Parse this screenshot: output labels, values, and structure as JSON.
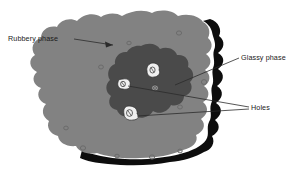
{
  "figure": {
    "background_color": "#ffffff"
  },
  "labels": {
    "rubbery": "Rubbery phase",
    "glassy": "Glassy phase",
    "holes": "Holes"
  },
  "colors": {
    "rubbery_phase": "#828282",
    "glassy_phase": "#4a4a4a",
    "shadow_edge": "#0d0d0d",
    "hole_fill": "#f2f2f2",
    "hole_detail": "#3d3d3d",
    "pore": "#6e6e6e",
    "leader_line": "#2b2b2b",
    "text": "#1a1a1a",
    "background": "#ffffff"
  },
  "regions": [
    {
      "name": "rubbery-phase",
      "label": "Rubbery phase",
      "fill": "#828282",
      "description": "Large irregular light-gray matrix blob occupying the centre of the figure"
    },
    {
      "name": "glassy-phase",
      "label": "Glassy phase",
      "fill": "#4a4a4a",
      "description": "Darker irregular domain embedded within the rubbery matrix, slightly right of centre"
    },
    {
      "name": "shadow-edge",
      "label": "",
      "fill": "#0d0d0d",
      "description": "Thick black drop-shadow rim along the right and bottom outline of the matrix"
    }
  ],
  "holes": [
    {
      "name": "hole-top",
      "cx": 153,
      "cy": 70,
      "r": 6.0
    },
    {
      "name": "hole-left",
      "cx": 123,
      "cy": 84,
      "r": 5.2
    },
    {
      "name": "hole-bottom",
      "cx": 130,
      "cy": 113,
      "r": 6.4
    },
    {
      "name": "hole-small-right",
      "cx": 155,
      "cy": 88,
      "r": 3.4
    }
  ],
  "pores": [
    {
      "cx": 179,
      "cy": 33
    },
    {
      "cx": 129,
      "cy": 43
    },
    {
      "cx": 101,
      "cy": 67
    },
    {
      "cx": 204,
      "cy": 82
    },
    {
      "cx": 180,
      "cy": 107
    },
    {
      "cx": 83,
      "cy": 148
    },
    {
      "cx": 117,
      "cy": 156
    },
    {
      "cx": 152,
      "cy": 157
    },
    {
      "cx": 180,
      "cy": 151
    },
    {
      "cx": 66,
      "cy": 128
    }
  ],
  "leaders": [
    {
      "name": "leader-rubbery",
      "from_label": "Rubbery phase",
      "arrow": true,
      "target": "rubbery-phase"
    },
    {
      "name": "leader-glassy",
      "from_label": "Glassy phase",
      "arrow": false,
      "target": "glassy-phase"
    },
    {
      "name": "leader-holes-a",
      "from_label": "Holes",
      "arrow": false,
      "target": "hole-left"
    },
    {
      "name": "leader-holes-b",
      "from_label": "Holes",
      "arrow": false,
      "target": "hole-bottom"
    }
  ]
}
